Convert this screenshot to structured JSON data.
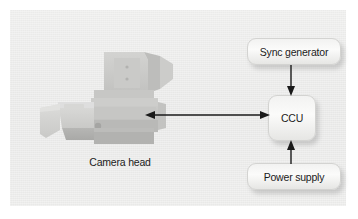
{
  "figure": {
    "background_color": "#ffffff",
    "panel_color": "#ececeb"
  },
  "diagram": {
    "title": "",
    "nodes": [
      {
        "id": "sync-generator",
        "label": "Sync generator",
        "shape": "rounded-rectangle",
        "fill": "#f6f6f5"
      },
      {
        "id": "ccu",
        "label": "CCU",
        "shape": "rounded-rectangle",
        "fill": "#f6f6f5"
      },
      {
        "id": "power-supply",
        "label": "Power supply",
        "shape": "rounded-rectangle",
        "fill": "#f6f6f5"
      },
      {
        "id": "camera-head",
        "label": "Camera head",
        "shape": "photo-illustration",
        "fill": "#c9c9c7"
      }
    ],
    "edges": [
      {
        "id": "camera-ccu",
        "from": "camera-head",
        "to": "ccu",
        "direction": "bidirectional",
        "color": "#1a1a1a"
      },
      {
        "id": "sync-ccu",
        "from": "sync-generator",
        "to": "ccu",
        "direction": "down",
        "color": "#1a1a1a"
      },
      {
        "id": "power-ccu",
        "from": "power-supply",
        "to": "ccu",
        "direction": "up",
        "color": "#1a1a1a"
      }
    ]
  },
  "camera_illustration": {
    "name": "broadcast-camera-head",
    "parts": [
      "lens-hood",
      "lens-barrel",
      "camera-body",
      "viewfinder",
      "top-handle",
      "side-plate",
      "record-button",
      "name-plate"
    ]
  }
}
